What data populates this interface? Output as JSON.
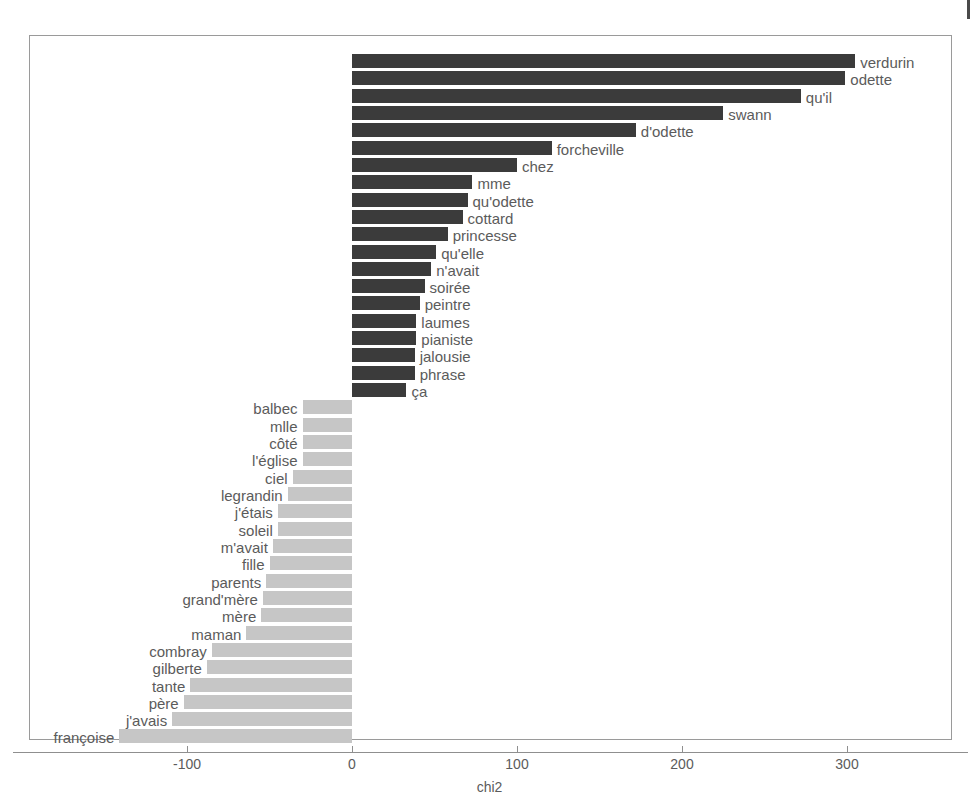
{
  "figure": {
    "background": "#ffffff",
    "panel_border_color": "#9a9a9a",
    "axis_color": "#8f8f8f",
    "text_color": "#5b5b5b",
    "positive_bar_color": "#3b3b3b",
    "negative_bar_color": "#c6c6c6"
  },
  "chart_data": {
    "type": "bar",
    "orientation": "horizontal",
    "title": "",
    "subtitle": "",
    "xlabel": "chi2",
    "ylabel": "",
    "xlim": [
      -155,
      352
    ],
    "xticks": [
      -100,
      0,
      100,
      200,
      300
    ],
    "xtick_labels": [
      "-100",
      "0",
      "100",
      "200",
      "300"
    ],
    "grid": false,
    "legend": "none",
    "zero_line": 0,
    "categories": [
      "verdurin",
      "odette",
      "qu'il",
      "swann",
      "d'odette",
      "forcheville",
      "chez",
      "mme",
      "qu'odette",
      "cottard",
      "princesse",
      "qu'elle",
      "n'avait",
      "soirée",
      "peintre",
      "laumes",
      "pianiste",
      "jalousie",
      "phrase",
      "ça",
      "balbec",
      "mlle",
      "côté",
      "l'église",
      "ciel",
      "legrandin",
      "j'étais",
      "soleil",
      "m'avait",
      "fille",
      "parents",
      "grand'mère",
      "mère",
      "maman",
      "combray",
      "gilberte",
      "tante",
      "père",
      "j'avais",
      "françoise"
    ],
    "values": [
      305,
      299,
      272,
      225,
      172,
      121,
      100,
      73,
      70,
      67,
      58,
      51,
      48,
      44,
      41,
      39,
      39,
      38,
      38,
      33,
      -30,
      -30,
      -30,
      -30,
      -36,
      -39,
      -45,
      -45,
      -48,
      -50,
      -52,
      -54,
      -55,
      -64,
      -85,
      -88,
      -98,
      -102,
      -109,
      -141
    ],
    "bar_colors": [
      "#3b3b3b",
      "#3b3b3b",
      "#3b3b3b",
      "#3b3b3b",
      "#3b3b3b",
      "#3b3b3b",
      "#3b3b3b",
      "#3b3b3b",
      "#3b3b3b",
      "#3b3b3b",
      "#3b3b3b",
      "#3b3b3b",
      "#3b3b3b",
      "#3b3b3b",
      "#3b3b3b",
      "#3b3b3b",
      "#3b3b3b",
      "#3b3b3b",
      "#3b3b3b",
      "#3b3b3b",
      "#c6c6c6",
      "#c6c6c6",
      "#c6c6c6",
      "#c6c6c6",
      "#c6c6c6",
      "#c6c6c6",
      "#c6c6c6",
      "#c6c6c6",
      "#c6c6c6",
      "#c6c6c6",
      "#c6c6c6",
      "#c6c6c6",
      "#c6c6c6",
      "#c6c6c6",
      "#c6c6c6",
      "#c6c6c6",
      "#c6c6c6",
      "#c6c6c6",
      "#c6c6c6",
      "#c6c6c6"
    ]
  }
}
